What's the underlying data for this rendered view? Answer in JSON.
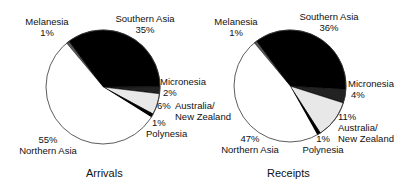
{
  "chart_data": [
    {
      "type": "pie",
      "title": "Arrivals",
      "categories": [
        "Melanesia",
        "Southern Asia",
        "Micronesia",
        "Australia/ New Zealand",
        "Polynesia",
        "Northern Asia"
      ],
      "values": [
        1,
        35,
        2,
        6,
        1,
        55
      ],
      "value_labels": [
        "1%",
        "35%",
        "2%",
        "6%",
        "1%",
        "55%"
      ],
      "colors": [
        "#555555",
        "#000000",
        "#222222",
        "#e8e8e8",
        "#000000",
        "#ffffff"
      ],
      "start_angle_deg": -40,
      "direction": "clockwise"
    },
    {
      "type": "pie",
      "title": "Receipts",
      "categories": [
        "Melanesia",
        "Southern Asia",
        "Micronesia",
        "Australia/ New Zealand",
        "Polynesia",
        "Northern Asia"
      ],
      "values": [
        1,
        36,
        4,
        11,
        1,
        47
      ],
      "value_labels": [
        "1%",
        "36%",
        "4%",
        "11%",
        "1%",
        "47%"
      ],
      "colors": [
        "#555555",
        "#000000",
        "#222222",
        "#e8e8e8",
        "#000000",
        "#ffffff"
      ],
      "start_angle_deg": -40,
      "direction": "clockwise"
    }
  ],
  "arrivals": {
    "caption": "Arrivals",
    "melanesia": {
      "name": "Melanesia",
      "pct": "1%"
    },
    "southern_asia": {
      "name": "Southern Asia",
      "pct": "35%"
    },
    "micronesia": {
      "name": "Micronesia",
      "pct": "2%"
    },
    "australia": {
      "name_line1": "Australia/",
      "name_line2": "New Zealand",
      "pct": "6%"
    },
    "polynesia": {
      "name": "Polynesia",
      "pct": "1%"
    },
    "northern_asia": {
      "name": "Northern Asia",
      "pct": "55%"
    }
  },
  "receipts": {
    "caption": "Receipts",
    "melanesia": {
      "name": "Melanesia",
      "pct": "1%"
    },
    "southern_asia": {
      "name": "Southern Asia",
      "pct": "36%"
    },
    "micronesia": {
      "name": "Micronesia",
      "pct": "4%"
    },
    "australia": {
      "name_line1": "Australia/",
      "name_line2": "New Zealand",
      "pct": "11%"
    },
    "polynesia": {
      "name": "Polynesia",
      "pct": "1%"
    },
    "northern_asia": {
      "name": "Northern Asia",
      "pct": "47%"
    }
  }
}
